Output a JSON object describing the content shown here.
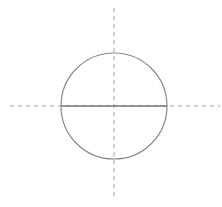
{
  "diagram": {
    "title": "",
    "colors": {
      "background": "#ffffff",
      "circle_stroke": "#8a8a8a",
      "diameter_stroke": "#7a7a7a",
      "axis_stroke": "#a0a0a0"
    },
    "circle": {
      "cx": 114,
      "cy": 106,
      "r": 53
    },
    "diameter": {
      "x1": 61,
      "y1": 106,
      "x2": 167,
      "y2": 106
    },
    "axes": {
      "horizontal": {
        "x1": 10,
        "y1": 106,
        "x2": 220,
        "y2": 106,
        "dash": "4 4"
      },
      "vertical": {
        "x1": 114,
        "y1": 8,
        "x2": 114,
        "y2": 197,
        "dash": "4 4"
      }
    }
  }
}
